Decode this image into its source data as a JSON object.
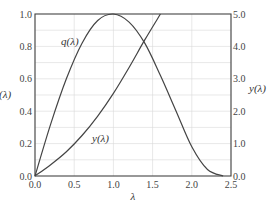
{
  "chart_data": {
    "type": "line",
    "title": "",
    "xlabel": "λ",
    "ylabel_left": "q(λ)",
    "ylabel_right": "y(λ)",
    "xlim": [
      0.0,
      2.5
    ],
    "ylim_left": [
      0.0,
      1.0
    ],
    "ylim_right": [
      0.0,
      5.0
    ],
    "x_ticks": [
      "0.0",
      "0.5",
      "1.0",
      "1.5",
      "2.0",
      "2.5"
    ],
    "y_left_ticks": [
      "0.0",
      "0.2",
      "0.4",
      "0.6",
      "0.8",
      "1.0"
    ],
    "y_right_ticks": [
      "0.0",
      "1.0",
      "2.0",
      "3.0",
      "4.0",
      "5.0"
    ],
    "grid": true,
    "series": [
      {
        "name": "q(λ)",
        "axis": "left",
        "x": [
          0.0,
          0.2,
          0.4,
          0.6,
          0.8,
          1.0,
          1.2,
          1.4,
          1.6,
          1.8,
          2.0,
          2.2,
          2.4
        ],
        "values": [
          0.0,
          0.32,
          0.6,
          0.82,
          0.96,
          1.0,
          0.95,
          0.82,
          0.62,
          0.4,
          0.18,
          0.04,
          0.0
        ]
      },
      {
        "name": "y(λ)",
        "axis": "right",
        "x": [
          0.0,
          0.2,
          0.4,
          0.6,
          0.8,
          1.0,
          1.2,
          1.4,
          1.6
        ],
        "values": [
          0.0,
          0.35,
          0.75,
          1.25,
          1.85,
          2.55,
          3.35,
          4.2,
          5.0
        ]
      }
    ],
    "annotations": [
      {
        "text": "q(λ)",
        "x": 0.55,
        "y_left": 0.83
      },
      {
        "text": "y(λ)",
        "x": 0.85,
        "y_right": 1.2
      }
    ]
  },
  "labels": {
    "x_axis": "λ",
    "left_axis": "(λ)",
    "right_axis": "y(λ)",
    "q_curve": "q(λ)",
    "y_curve": "y(λ)"
  }
}
